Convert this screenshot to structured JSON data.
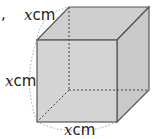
{
  "figure": {
    "type": "cube",
    "marker": ",",
    "labels": {
      "top_edge": {
        "var": "x",
        "unit": "cm"
      },
      "left_edge": {
        "var": "x",
        "unit": "cm"
      },
      "bottom_edge": {
        "var": "x",
        "unit": "cm"
      }
    },
    "colors": {
      "face_front": "#d4d4d4",
      "face_top": "#cfcfcf",
      "face_side": "#c8c8c8",
      "edge": "#555555",
      "hidden_edge": "#444444",
      "arc": "#888888"
    }
  }
}
